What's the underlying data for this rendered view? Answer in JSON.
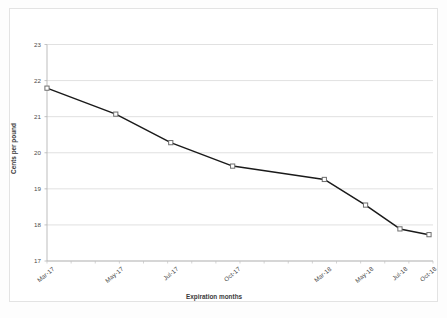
{
  "chart_data": {
    "type": "line",
    "title": "",
    "xlabel": "Expiration months",
    "ylabel": "Cents per pound",
    "categories": [
      "Mar-17",
      "May-17",
      "Jul-17",
      "Oct-17",
      "Mar-18",
      "May-18",
      "Jul-18",
      "Oct-18"
    ],
    "x_tick_labels": [
      "Mar-17",
      "May-17",
      "Jul-17",
      "Oct-17",
      "Mar-18",
      "May-18",
      "Jul-18",
      "Oct-18"
    ],
    "y_tick_labels": [
      "17",
      "18",
      "19",
      "20",
      "21",
      "22",
      "23"
    ],
    "ylim": [
      17,
      23
    ],
    "y_ticks": [
      17,
      18,
      19,
      20,
      21,
      22,
      23
    ],
    "grid": true,
    "legend": false,
    "legend_position": "none",
    "marker": "open-square",
    "line_color": "#1a1a1a",
    "marker_fill": "#ffffff",
    "marker_edge": "#6e6e6e",
    "grid_color": "#d9d9d9",
    "series": [
      {
        "name": "Futures price",
        "points": [
          {
            "x": "Mar-17",
            "y": 21.79
          },
          {
            "x": "May-17",
            "y": 21.07
          },
          {
            "x": "Jul-17",
            "y": 20.28
          },
          {
            "x": "Oct-17",
            "y": 19.63
          },
          {
            "x": "Mar-18",
            "y": 19.26
          },
          {
            "x": "May-18",
            "y": 18.55
          },
          {
            "x": "Jul-18",
            "y": 17.89
          },
          {
            "x": "Oct-18",
            "y": 17.73
          }
        ],
        "values": [
          21.79,
          21.07,
          20.28,
          19.63,
          19.26,
          18.55,
          17.89,
          17.73
        ]
      }
    ]
  },
  "axes": {
    "y_title": "Cents per pound",
    "x_title": "Expiration months"
  }
}
